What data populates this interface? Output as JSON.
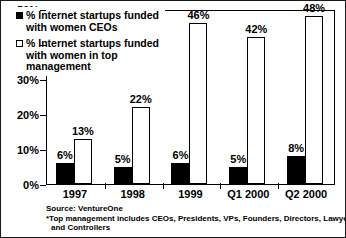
{
  "chart_data": {
    "type": "bar",
    "title": "",
    "subtitle": "",
    "xlabel": "",
    "ylabel": "",
    "ylim": [
      0,
      50
    ],
    "ytick_labels": [
      "0%",
      "10%",
      "20%",
      "30%",
      "40%",
      "50%"
    ],
    "ytick_values": [
      0,
      10,
      20,
      30,
      40,
      50
    ],
    "grid": false,
    "legend_position": "top-left-inside",
    "categories": [
      "1997",
      "1998",
      "1999",
      "Q1 2000",
      "Q2 2000"
    ],
    "series": [
      {
        "name": "% Internet startups funded with women CEOs",
        "style": "solid-black",
        "values": [
          6,
          5,
          6,
          5,
          8
        ],
        "labels": [
          "6%",
          "5%",
          "6%",
          "5%",
          "8%"
        ]
      },
      {
        "name": "% Internet startups funded with women in top management",
        "style": "hollow-white",
        "values": [
          13,
          22,
          46,
          42,
          48
        ],
        "labels": [
          "13%",
          "22%",
          "46%",
          "42%",
          "48%"
        ]
      }
    ],
    "annotations": [
      "Source: VentureOne",
      "*Top management includes CEOs, Presidents, VPs, Founders, Directors, Lawyers, and Controllers"
    ]
  },
  "legend": {
    "entries": [
      {
        "swatch": "solid-black",
        "lines": [
          "% Internet startups funded",
          "with women CEOs"
        ]
      },
      {
        "swatch": "hollow-white",
        "lines": [
          "% Internet startups funded",
          "with women in top",
          "management"
        ]
      }
    ]
  },
  "notes": {
    "source": "Source: VentureOne",
    "footnote_line1": "*Top management includes CEOs, Presidents, VPs, Founders, Directors, Lawyers,",
    "footnote_line2": "and Controllers"
  },
  "colors": {
    "series_one": "#000000",
    "series_two": "#ffffff",
    "axis": "#000000",
    "background": "#ffffff"
  }
}
